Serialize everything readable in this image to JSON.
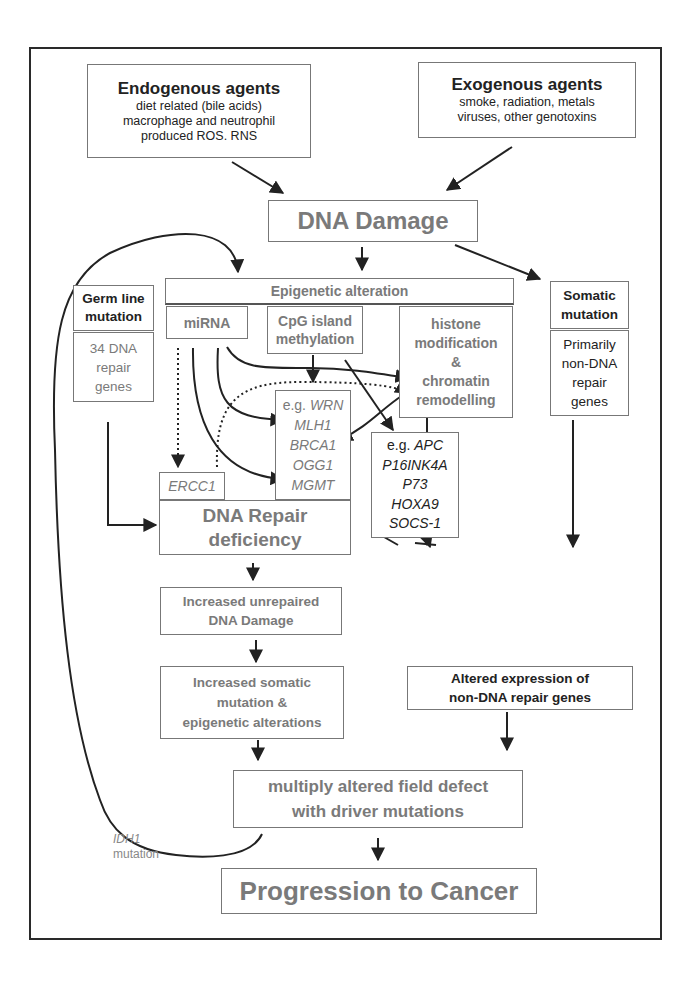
{
  "diagram": {
    "endogenous": {
      "title": "Endogenous agents",
      "lines": [
        "diet related (bile acids)",
        "macrophage and neutrophil",
        "produced ROS. RNS"
      ]
    },
    "exogenous": {
      "title": "Exogenous agents",
      "lines": [
        "smoke, radiation, metals",
        "viruses, other genotoxins"
      ]
    },
    "dna_damage": "DNA Damage",
    "epigenetic_alteration": "Epigenetic alteration",
    "mirna": "miRNA",
    "cpg": [
      "CpG island",
      "methylation"
    ],
    "histone": [
      "histone",
      "modification",
      "&",
      "chromatin",
      "remodelling"
    ],
    "germ_line": {
      "title": [
        "Germ line",
        "mutation"
      ],
      "body": [
        "34 DNA",
        "repair",
        "genes"
      ]
    },
    "somatic": {
      "title": [
        "Somatic",
        "mutation"
      ],
      "body": [
        "Primarily",
        "non-DNA",
        "repair",
        "genes"
      ]
    },
    "repair_genes": {
      "prefix": "e.g. ",
      "genes": [
        "WRN",
        "MLH1",
        "BRCA1",
        "OGG1",
        "MGMT"
      ]
    },
    "ercc1": "ERCC1",
    "non_repair_genes": {
      "prefix": "e.g. ",
      "genes": [
        "APC",
        "P16INK4A",
        "P73",
        "HOXA9",
        "SOCS-1"
      ]
    },
    "dna_repair_deficiency": [
      "DNA Repair",
      "deficiency"
    ],
    "increased_unrepaired": [
      "Increased unrepaired",
      "DNA Damage"
    ],
    "increased_somatic": [
      "Increased somatic",
      "mutation &",
      "epigenetic alterations"
    ],
    "altered_expression": [
      "Altered expression of",
      "non-DNA repair genes"
    ],
    "field_defect": [
      "multiply altered field defect",
      "with driver mutations"
    ],
    "progression": "Progression to Cancer",
    "idh1": {
      "gene": "IDH1",
      "word": "mutation"
    }
  }
}
